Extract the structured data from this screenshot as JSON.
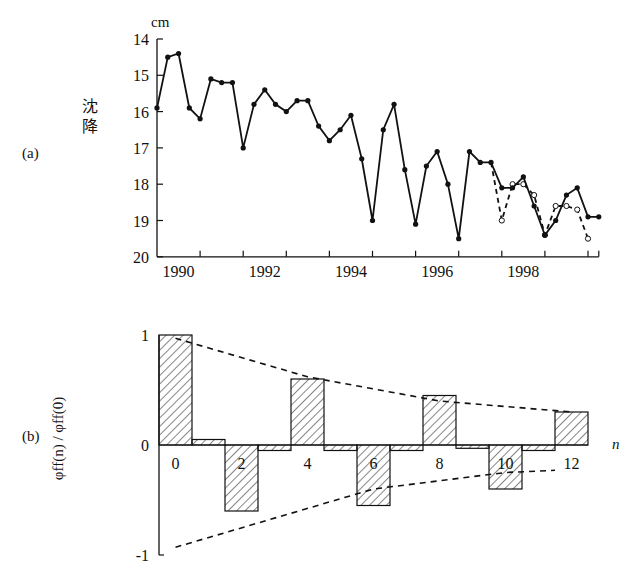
{
  "panels": {
    "a": {
      "label": "(a)",
      "ylabel_lines": [
        "沈",
        "降"
      ],
      "unit": "cm"
    },
    "b": {
      "label": "(b)",
      "ylabel": "φff(n) / φff(0)",
      "xlabel": "n"
    }
  },
  "chart_data": [
    {
      "type": "line",
      "panel": "(a)",
      "title": "",
      "xlabel": "",
      "ylabel": "沈降 (cm)",
      "y_inverted": true,
      "ylim": [
        20,
        14
      ],
      "yticks": [
        14,
        15,
        16,
        17,
        18,
        19,
        20
      ],
      "xlim": [
        1989.5,
        1999.75
      ],
      "xtick_labels": [
        "1990",
        "1992",
        "1994",
        "1996",
        "1998"
      ],
      "grid": false,
      "series": [
        {
          "name": "observed",
          "style": "solid, filled circles",
          "x": [
            1989.5,
            1989.75,
            1990.0,
            1990.25,
            1990.5,
            1990.75,
            1991.0,
            1991.25,
            1991.5,
            1991.75,
            1992.0,
            1992.25,
            1992.5,
            1992.75,
            1993.0,
            1993.25,
            1993.5,
            1993.75,
            1994.0,
            1994.25,
            1994.5,
            1994.75,
            1995.0,
            1995.25,
            1995.5,
            1995.75,
            1996.0,
            1996.25,
            1996.5,
            1996.75,
            1997.0,
            1997.25,
            1997.5,
            1997.75,
            1998.0,
            1998.25,
            1998.5,
            1998.75,
            1999.0,
            1999.25,
            1999.5,
            1999.75
          ],
          "values": [
            15.9,
            14.5,
            14.4,
            15.9,
            16.2,
            15.1,
            15.2,
            15.2,
            17.0,
            15.8,
            15.4,
            15.8,
            16.0,
            15.7,
            15.7,
            16.4,
            16.8,
            16.5,
            16.1,
            17.3,
            19.0,
            16.5,
            15.8,
            17.6,
            19.1,
            17.5,
            17.1,
            18.0,
            19.5,
            17.1,
            17.4,
            17.4,
            18.1,
            18.1,
            17.8,
            18.6,
            19.4,
            19.0,
            18.3,
            18.1,
            18.9,
            18.9
          ]
        },
        {
          "name": "predicted",
          "style": "dashed, open circles",
          "x": [
            1997.25,
            1997.5,
            1997.75,
            1998.0,
            1998.25,
            1998.5,
            1998.75,
            1999.0,
            1999.25,
            1999.5
          ],
          "values": [
            17.4,
            19.0,
            18.0,
            18.0,
            18.3,
            19.4,
            18.6,
            18.6,
            18.7,
            19.5
          ]
        }
      ]
    },
    {
      "type": "bar",
      "panel": "(b)",
      "title": "",
      "xlabel": "n",
      "ylabel": "φff(n) / φff(0)",
      "ylim": [
        -1,
        1
      ],
      "yticks": [
        -1,
        0,
        1
      ],
      "xtick_labels": [
        "0",
        "2",
        "4",
        "6",
        "8",
        "10",
        "12"
      ],
      "categories": [
        0,
        1,
        2,
        3,
        4,
        5,
        6,
        7,
        8,
        9,
        10,
        11,
        12
      ],
      "values": [
        1.0,
        0.05,
        -0.6,
        -0.05,
        0.6,
        -0.05,
        -0.55,
        -0.05,
        0.45,
        -0.03,
        -0.4,
        -0.05,
        0.3
      ],
      "bar_fill": "diagonal hatch",
      "envelope": {
        "style": "dashed",
        "upper": [
          [
            0.5,
            0.97
          ],
          [
            4.5,
            0.62
          ],
          [
            8.5,
            0.4
          ],
          [
            12.5,
            0.3
          ]
        ],
        "lower": [
          [
            0.5,
            -0.93
          ],
          [
            6.5,
            -0.4
          ],
          [
            10.5,
            -0.25
          ],
          [
            12,
            -0.23
          ]
        ]
      },
      "grid": false
    }
  ]
}
